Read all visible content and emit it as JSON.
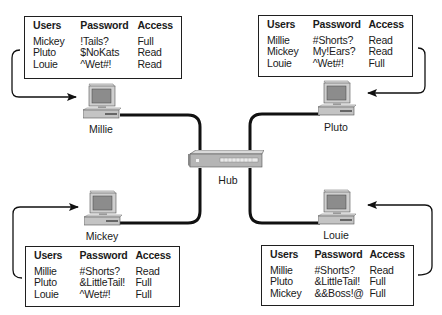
{
  "diagram": {
    "hub": {
      "label": "Hub"
    },
    "computers": [
      {
        "name": "Millie",
        "acl": {
          "headers": [
            "Users",
            "Password",
            "Access"
          ],
          "rows": [
            [
              "Mickey",
              "!Tails?",
              "Full"
            ],
            [
              "Pluto",
              "$NoKats",
              "Read"
            ],
            [
              "Louie",
              "^Wet#!",
              "Read"
            ]
          ]
        }
      },
      {
        "name": "Pluto",
        "acl": {
          "headers": [
            "Users",
            "Password",
            "Access"
          ],
          "rows": [
            [
              "Millie",
              "#Shorts?",
              "Read"
            ],
            [
              "Mickey",
              "My!Ears?",
              "Read"
            ],
            [
              "Louie",
              "^Wet#!",
              "Full"
            ]
          ]
        }
      },
      {
        "name": "Mickey",
        "acl": {
          "headers": [
            "Users",
            "Password",
            "Access"
          ],
          "rows": [
            [
              "Millie",
              "#Shorts?",
              "Read"
            ],
            [
              "Pluto",
              "&LittleTail!",
              "Full"
            ],
            [
              "Louie",
              "^Wet#!",
              "Full"
            ]
          ]
        }
      },
      {
        "name": "Louie",
        "acl": {
          "headers": [
            "Users",
            "Password",
            "Access"
          ],
          "rows": [
            [
              "Millie",
              "#Shorts?",
              "Read"
            ],
            [
              "Pluto",
              "&LittleTail!",
              "Full"
            ],
            [
              "Mickey",
              "&&Boss!@",
              "Full"
            ]
          ]
        }
      }
    ]
  }
}
